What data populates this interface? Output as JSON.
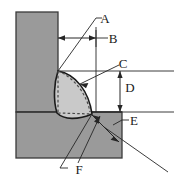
{
  "figure": {
    "type": "technical-cross-section-diagram",
    "background_color": "#ffffff",
    "line_color": "#262626",
    "plate_fill_color": "#9a9a9a",
    "plate_edge_color": "#3a3a3a",
    "weld_bead_fill_color": "#c9c9c9",
    "weld_bead_edge_color": "#1a1a1a",
    "dashed_line_color": "#555555"
  },
  "parts": {
    "vertical_plate": {
      "name": "vertical-plate",
      "x": 16,
      "y": 12,
      "width": 42,
      "height": 100
    },
    "horizontal_plate": {
      "name": "horizontal-plate",
      "x": 16,
      "y": 112,
      "width": 106,
      "height": 46
    },
    "weld_bead": {
      "name": "weld-bead",
      "root_point": [
        58,
        71
      ],
      "toe_point": [
        92,
        114
      ],
      "description": "convex fillet weld bead profile with dashed internal construction lines"
    }
  },
  "labels": [
    {
      "id": "A",
      "text": "A",
      "x": 105,
      "y": 18,
      "meaning": "weld leg / root leader"
    },
    {
      "id": "B",
      "text": "B",
      "x": 113,
      "y": 42,
      "meaning": "horizontal weld leg dimension"
    },
    {
      "id": "C",
      "text": "C",
      "x": 122,
      "y": 67,
      "meaning": "weld bead face leader"
    },
    {
      "id": "D",
      "text": "D",
      "x": 129,
      "y": 88,
      "meaning": "vertical weld leg dimension"
    },
    {
      "id": "E",
      "text": "E",
      "x": 132,
      "y": 126,
      "meaning": "weld throat dimension"
    },
    {
      "id": "F",
      "text": "F",
      "x": 78,
      "y": 174,
      "meaning": "weld toe leader"
    }
  ],
  "dimensions": {
    "B": {
      "label": "B",
      "type": "horizontal-double-arrow",
      "from": [
        58,
        38
      ],
      "to": [
        96,
        38
      ]
    },
    "D": {
      "label": "D",
      "type": "vertical-double-arrow",
      "from": [
        120,
        71
      ],
      "to": [
        120,
        112
      ]
    },
    "E": {
      "label": "E",
      "type": "diagonal-double-arrow",
      "from": [
        92,
        116
      ],
      "to": [
        118,
        141
      ]
    }
  },
  "reference_lines": {
    "upper_horizontal": {
      "y": 71,
      "x_start": 58,
      "x_end": 174
    },
    "lower_horizontal": {
      "y": 112,
      "x_start": 92,
      "x_end": 174
    },
    "vertical_extension": {
      "x": 96,
      "y_start": 28,
      "y_end": 112
    }
  }
}
